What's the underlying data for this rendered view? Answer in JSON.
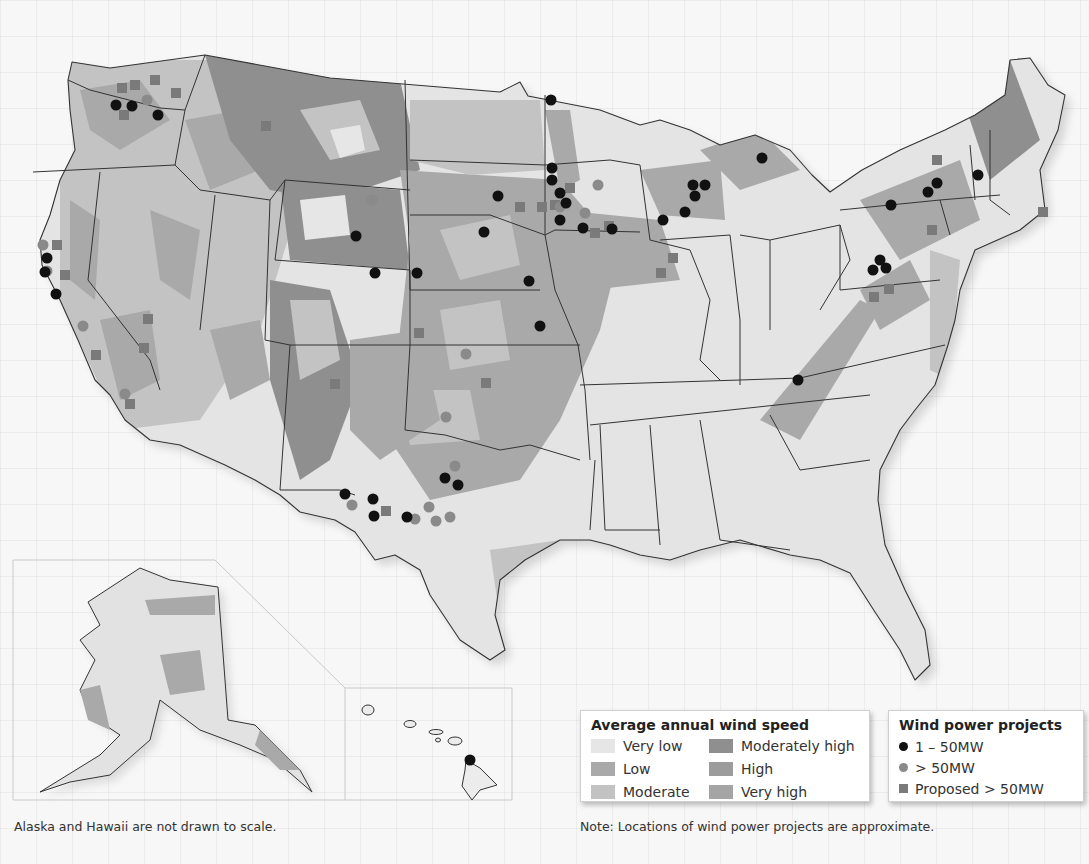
{
  "map": {
    "subject": "United States average annual wind speed and wind power projects",
    "inset_note": "Alaska and Hawaii are not drawn to scale.",
    "locations_note": "Note: Locations of wind power projects are approximate."
  },
  "legend_wind": {
    "title": "Average annual wind speed",
    "items": [
      {
        "label": "Very low",
        "color": "#e6e6e6"
      },
      {
        "label": "Moderately high",
        "color": "#8f8f8f"
      },
      {
        "label": "Low",
        "color": "#a9a9a9"
      },
      {
        "label": "High",
        "color": "#9c9c9c"
      },
      {
        "label": "Moderate",
        "color": "#c3c3c3"
      },
      {
        "label": "Very high",
        "color": "#a5a5a5"
      }
    ]
  },
  "legend_projects": {
    "title": "Wind power projects",
    "items": [
      {
        "label": "1 – 50MW",
        "symbol": "black-dot",
        "color": "#111111"
      },
      {
        "label": "> 50MW",
        "symbol": "grey-dot",
        "color": "#8a8a8a"
      },
      {
        "label": "Proposed > 50MW",
        "symbol": "grey-square",
        "color": "#7a7a7a"
      }
    ]
  },
  "projects": {
    "small": [
      [
        116,
        105
      ],
      [
        132,
        106
      ],
      [
        158,
        115
      ],
      [
        47,
        258
      ],
      [
        45,
        272
      ],
      [
        56,
        294
      ],
      [
        356,
        236
      ],
      [
        375,
        273
      ],
      [
        417,
        273
      ],
      [
        498,
        196
      ],
      [
        484,
        232
      ],
      [
        551,
        100
      ],
      [
        552,
        168
      ],
      [
        552,
        180
      ],
      [
        560,
        193
      ],
      [
        566,
        203
      ],
      [
        560,
        220
      ],
      [
        583,
        228
      ],
      [
        612,
        229
      ],
      [
        529,
        281
      ],
      [
        540,
        326
      ],
      [
        663,
        220
      ],
      [
        693,
        185
      ],
      [
        705,
        185
      ],
      [
        695,
        196
      ],
      [
        685,
        212
      ],
      [
        762,
        158
      ],
      [
        891,
        205
      ],
      [
        928,
        192
      ],
      [
        937,
        183
      ],
      [
        978,
        175
      ],
      [
        880,
        260
      ],
      [
        873,
        270
      ],
      [
        886,
        268
      ],
      [
        798,
        380
      ],
      [
        445,
        478
      ],
      [
        458,
        485
      ],
      [
        345,
        494
      ],
      [
        373,
        499
      ],
      [
        374,
        516
      ],
      [
        407,
        517
      ],
      [
        470,
        760
      ]
    ],
    "large": [
      [
        147,
        100
      ],
      [
        43,
        245
      ],
      [
        47,
        271
      ],
      [
        560,
        207
      ],
      [
        585,
        213
      ],
      [
        598,
        185
      ],
      [
        466,
        354
      ],
      [
        446,
        417
      ],
      [
        455,
        466
      ],
      [
        352,
        505
      ],
      [
        415,
        519
      ],
      [
        429,
        507
      ],
      [
        436,
        521
      ],
      [
        450,
        517
      ],
      [
        372,
        200
      ],
      [
        83,
        326
      ],
      [
        125,
        394
      ]
    ],
    "proposed": [
      [
        122,
        88
      ],
      [
        135,
        85
      ],
      [
        155,
        80
      ],
      [
        176,
        93
      ],
      [
        124,
        115
      ],
      [
        266,
        126
      ],
      [
        57,
        245
      ],
      [
        65,
        275
      ],
      [
        148,
        319
      ],
      [
        96,
        355
      ],
      [
        144,
        348
      ],
      [
        130,
        404
      ],
      [
        520,
        207
      ],
      [
        542,
        207
      ],
      [
        555,
        205
      ],
      [
        570,
        188
      ],
      [
        595,
        233
      ],
      [
        609,
        226
      ],
      [
        673,
        258
      ],
      [
        661,
        273
      ],
      [
        419,
        333
      ],
      [
        486,
        383
      ],
      [
        386,
        511
      ],
      [
        937,
        160
      ],
      [
        932,
        230
      ],
      [
        1043,
        212
      ],
      [
        889,
        289
      ],
      [
        874,
        297
      ],
      [
        335,
        384
      ]
    ]
  }
}
